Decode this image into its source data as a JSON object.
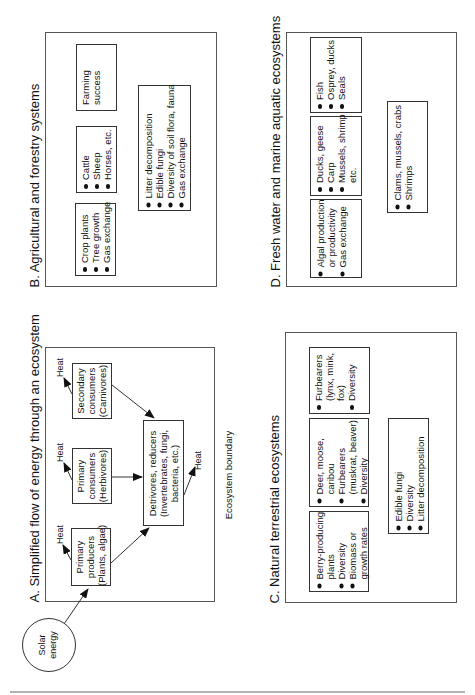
{
  "panels": {
    "A": {
      "title": "A.  Simplified flow of energy through an ecosystem",
      "boundary_label": "Ecosystem boundary",
      "solar": [
        "Solar",
        "energy"
      ],
      "heat_label": "Heat",
      "nodes": {
        "producers": [
          "Primary",
          "producers",
          "(Plants, algae)"
        ],
        "primary_consumers": [
          "Primary",
          "consumers",
          "(Herbivores)"
        ],
        "secondary_consumers": [
          "Secondary",
          "consumers",
          "(Carnivores)"
        ],
        "detrivores": [
          "Detrivores, reducers",
          "(Invertebrates, fungi,",
          "bacteria, etc.)"
        ]
      }
    },
    "B": {
      "title": "B.  Agricultural and forestry systems",
      "boxes": {
        "crops": [
          "Crop plants",
          "Tree growth",
          "Gas exchange"
        ],
        "livestock": [
          "Cattle",
          "Sheep",
          "Horses, etc."
        ],
        "farming": [
          "Farming",
          "success"
        ],
        "soil": [
          "Litter decomposition",
          "Edible fungi",
          "Diversity of soil flora, fauna",
          "Gas exchange"
        ]
      }
    },
    "C": {
      "title": "C.  Natural terrestrial ecosystems",
      "boxes": {
        "plants": [
          "Berry-producing\nplants",
          "Diversity",
          "Biomass or\ngrowth rates"
        ],
        "herbivores": [
          "Deer, moose,\ncaribou",
          "Furbearers\n(muskrat, beaver)",
          "Diversity"
        ],
        "carnivores": [
          "Furbearers\n(lynx, mink,\nfox)",
          "Diversity"
        ],
        "soil": [
          "Edible fungi",
          "Diversity",
          "Litter decomposition"
        ]
      }
    },
    "D": {
      "title": "D.  Fresh water and marine aquatic ecosystems",
      "boxes": {
        "producers": [
          "Algal production\nor productivity",
          "Gas exchange"
        ],
        "consumers": [
          "Ducks, geese",
          "Carp",
          "Mussels, shrimp\netc."
        ],
        "predators": [
          "Fish",
          "Osprey, ducks",
          "Seals"
        ],
        "benthos": [
          "Clams, mussels, crabs",
          "Shrimps"
        ]
      }
    }
  },
  "colors": {
    "line": "#333333",
    "panel_border": "#555555",
    "background": "#ffffff"
  }
}
